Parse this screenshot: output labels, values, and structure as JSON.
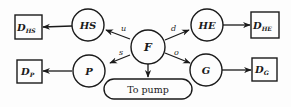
{
  "diagram": {
    "type": "flow",
    "colors": {
      "stroke": "#1a1a1a",
      "background": "#fdfdfd"
    },
    "center_node": {
      "id": "F",
      "label": "F"
    },
    "circle_nodes": [
      {
        "id": "HS",
        "label": "HS"
      },
      {
        "id": "HE",
        "label": "HE"
      },
      {
        "id": "P",
        "label": "P"
      },
      {
        "id": "G",
        "label": "G"
      }
    ],
    "sink_boxes": [
      {
        "id": "DHS",
        "main": "D",
        "sub": "HS"
      },
      {
        "id": "DHE",
        "main": "D",
        "sub": "HE"
      },
      {
        "id": "DP",
        "main": "D",
        "sub": "P"
      },
      {
        "id": "DG",
        "main": "D",
        "sub": "G"
      }
    ],
    "edge_labels": {
      "F_HS": "u",
      "F_HE": "d",
      "F_P": "s",
      "F_G": "o"
    },
    "pump": {
      "label": "To pump"
    },
    "edges": [
      {
        "from": "F",
        "to": "HS",
        "label": "u"
      },
      {
        "from": "F",
        "to": "HE",
        "label": "d"
      },
      {
        "from": "F",
        "to": "P",
        "label": "s"
      },
      {
        "from": "F",
        "to": "G",
        "label": "o"
      },
      {
        "from": "F",
        "to": "pump",
        "label": ""
      },
      {
        "from": "HS",
        "to": "DHS",
        "label": ""
      },
      {
        "from": "HE",
        "to": "DHE",
        "label": ""
      },
      {
        "from": "P",
        "to": "DP",
        "label": ""
      },
      {
        "from": "G",
        "to": "DG",
        "label": ""
      }
    ]
  }
}
